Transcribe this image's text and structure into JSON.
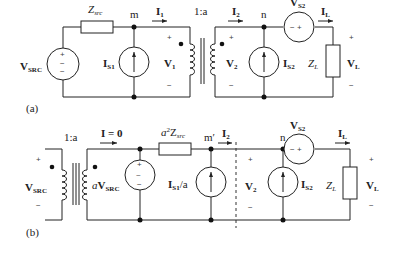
{
  "figure_a": {
    "caption": "(a)",
    "source": {
      "label": "V",
      "sub": "SRC",
      "plus": "+",
      "minus": "−"
    },
    "impedance": {
      "label": "Z",
      "sub": "src"
    },
    "node_m": "m",
    "node_n": "n",
    "current_I1": {
      "label": "I",
      "sub": "1"
    },
    "current_I2": {
      "label": "I",
      "sub": "2"
    },
    "current_IL": {
      "label": "I",
      "sub": "L"
    },
    "transformer_ratio": "1:a",
    "current_source_1": {
      "label": "I",
      "sub": "S1"
    },
    "current_source_2": {
      "label": "I",
      "sub": "S2"
    },
    "voltage_V1": {
      "label": "V",
      "sub": "1",
      "plus": "+",
      "minus": "−"
    },
    "voltage_V2": {
      "label": "V",
      "sub": "2",
      "plus": "+",
      "minus": "−"
    },
    "series_source": {
      "label": "V",
      "sub": "S2",
      "inner": "− +"
    },
    "load": {
      "label": "Z",
      "sub": "L"
    },
    "voltage_VL": {
      "label": "V",
      "sub": "L",
      "plus": "+",
      "minus": "−"
    }
  },
  "figure_b": {
    "caption": "(b)",
    "source": {
      "label": "V",
      "sub": "SRC",
      "plus": "+",
      "minus": "−"
    },
    "transformer_ratio": "1:a",
    "current_zero": "I = 0",
    "reflected_source": {
      "prefix": "a",
      "label": "V",
      "sub": "SRC",
      "inner": "~"
    },
    "reflected_impedance": {
      "prefix": "a",
      "sup": "2",
      "label": "Z",
      "sub": "src"
    },
    "node_m_prime": "m′",
    "node_n": "n",
    "current_I2": {
      "label": "I",
      "sub": "2"
    },
    "current_IL": {
      "label": "I",
      "sub": "L"
    },
    "reflected_current_source": {
      "label": "I",
      "sub": "S1",
      "suffix": "/a"
    },
    "current_source_2": {
      "label": "I",
      "sub": "S2"
    },
    "voltage_V2": {
      "label": "V",
      "sub": "2",
      "plus": "+",
      "minus": "−"
    },
    "series_source": {
      "label": "V",
      "sub": "S2",
      "inner": "− +"
    },
    "load": {
      "label": "Z",
      "sub": "L"
    },
    "voltage_VL": {
      "label": "V",
      "sub": "L",
      "plus": "+",
      "minus": "−"
    }
  }
}
